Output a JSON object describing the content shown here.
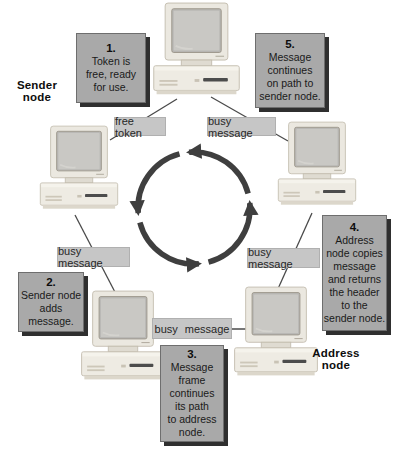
{
  "diagram_type": "token-ring-network",
  "ring": {
    "direction": "counterclockwise",
    "node_count": 5
  },
  "labels": {
    "sender_node": "Sender\nnode",
    "address_node": "Address\nnode"
  },
  "steps": [
    {
      "num": "1.",
      "text": "Token is\nfree, ready\nfor use."
    },
    {
      "num": "2.",
      "text": "Sender node\nadds\nmessage."
    },
    {
      "num": "3.",
      "text": "Message\nframe\ncontinues\nits path\nto address\nnode."
    },
    {
      "num": "4.",
      "text": "Address\nnode copies\nmessage\nand returns\nthe header\nto the\nsender node."
    },
    {
      "num": "5.",
      "text": "Message\ncontinues\non path to\nsender node."
    }
  ],
  "link_labels": {
    "top_left": "free token",
    "top_right": "busy message",
    "mid_left": "busy message",
    "mid_right": "busy message",
    "bottom": "busy message"
  },
  "colors": {
    "background": "#ffffff",
    "step_box_fill": "#a9a9a9",
    "step_box_border": "#6e6e6e",
    "step_box_shadow": "#2f2f2f",
    "link_label_fill": "#c6c6c6",
    "ring_arrow": "#3f3f3f",
    "connection_line": "#4a4a4a",
    "text": "#1a1a1a",
    "computer_body": "#ebe8e0",
    "computer_screen": "#c9c8c4"
  }
}
